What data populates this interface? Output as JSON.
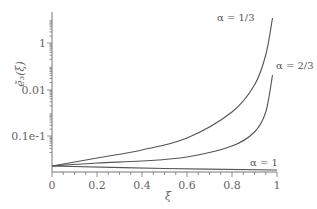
{
  "chart_data": {
    "type": "line",
    "title": "",
    "xlabel": "ξ",
    "ylabel": "ẽ₃(ξ)",
    "y_scale": "log",
    "xlim": [
      0,
      1
    ],
    "x_ticks": [
      "0",
      "0.2",
      "0.4",
      "0.6",
      "0.8",
      "1"
    ],
    "y_ticks": [
      "1",
      "0.01",
      "0.1e-1"
    ],
    "grid": false,
    "legend": "inline annotations",
    "series": [
      {
        "name": "α = 1/3",
        "x": [
          0,
          0.2,
          0.4,
          0.6,
          0.8,
          0.9,
          0.95,
          0.98
        ],
        "pixel_y": [
          166,
          158,
          150,
          138,
          112,
          85,
          55,
          18
        ]
      },
      {
        "name": "α = 2/3",
        "x": [
          0,
          0.2,
          0.4,
          0.6,
          0.8,
          0.9,
          0.95,
          0.98
        ],
        "pixel_y": [
          166,
          163,
          161,
          157,
          146,
          132,
          112,
          75
        ]
      },
      {
        "name": "α = 1",
        "x": [
          0,
          0.5,
          1
        ],
        "pixel_y": [
          166,
          168.5,
          170
        ]
      }
    ],
    "annotations": [
      "α = 1/3",
      "α = 2/3",
      "α = 1"
    ]
  },
  "labels": {
    "xlabel": "ξ",
    "ylabel": "ẽ₃(ξ)",
    "xticks": [
      "0",
      "0.2",
      "0.4",
      "0.6",
      "0.8",
      "1"
    ],
    "yticks": [
      "1",
      "0.01",
      "0.1e-1"
    ],
    "annot_a13": "α = 1/3",
    "annot_a23": "α = 2/3",
    "annot_a1": "α = 1"
  }
}
